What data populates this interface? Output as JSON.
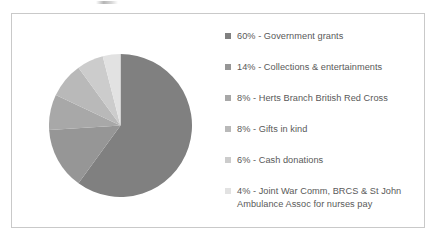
{
  "chart_data": {
    "type": "pie",
    "title": "",
    "subtitle": "",
    "xlabel": "",
    "ylabel": "",
    "grid": false,
    "legend_position": "right",
    "start_angle_deg": 0,
    "direction": "clockwise",
    "categories": [
      "Government grants",
      "Collections & entertainments",
      "Herts Branch British Red Cross",
      "Gifts in kind",
      "Cash donations",
      "Joint War Comm, BRCS & St John Ambulance Assoc for nurses pay"
    ],
    "values": [
      60,
      14,
      8,
      8,
      6,
      4
    ],
    "value_unit": "%",
    "colors": [
      "#808080",
      "#969696",
      "#a8a8a8",
      "#b9b9b9",
      "#cccccc",
      "#e2e2e2"
    ]
  },
  "legend": {
    "items": [
      {
        "swatch_name": "legend-swatch-government-grants",
        "color": "#808080",
        "text": "60% - Government grants",
        "line2": ""
      },
      {
        "swatch_name": "legend-swatch-collections-entertainments",
        "color": "#969696",
        "text": "14% - Collections & entertainments",
        "line2": ""
      },
      {
        "swatch_name": "legend-swatch-herts-branch-british-red-cross",
        "color": "#a8a8a8",
        "text": "8% - Herts Branch British Red Cross",
        "line2": ""
      },
      {
        "swatch_name": "legend-swatch-gifts-in-kind",
        "color": "#b9b9b9",
        "text": "8% - Gifts in kind",
        "line2": ""
      },
      {
        "swatch_name": "legend-swatch-cash-donations",
        "color": "#cccccc",
        "text": "6% - Cash donations",
        "line2": ""
      },
      {
        "swatch_name": "legend-swatch-joint-war-comm",
        "color": "#e2e2e2",
        "text": "4% - Joint War Comm, BRCS & St John",
        "line2": "Ambulance Assoc for nurses pay"
      }
    ]
  },
  "frame": {
    "border_color": "#c9c9c9",
    "background": "#ffffff"
  }
}
